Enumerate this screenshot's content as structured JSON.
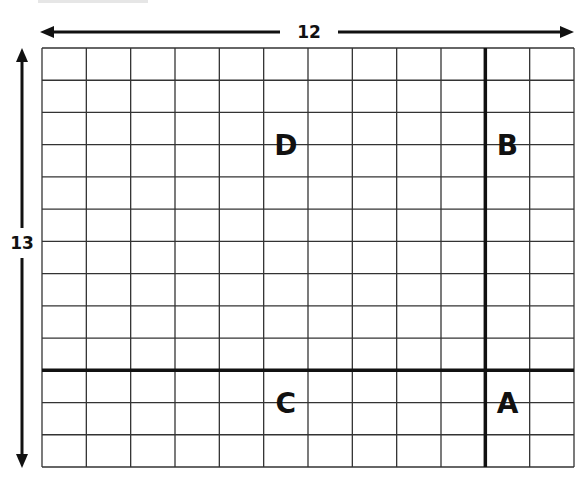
{
  "diagram": {
    "type": "grid",
    "columns": 12,
    "rows": 13,
    "width_label": "12",
    "height_label": "13",
    "divider_column": 10,
    "divider_row": 10,
    "regions": [
      {
        "label": "D",
        "position": "top-left"
      },
      {
        "label": "B",
        "position": "top-right"
      },
      {
        "label": "C",
        "position": "bottom-left"
      },
      {
        "label": "A",
        "position": "bottom-right"
      }
    ],
    "colors": {
      "line": "#333333",
      "thick_line": "#111111",
      "background": "#ffffff"
    }
  }
}
